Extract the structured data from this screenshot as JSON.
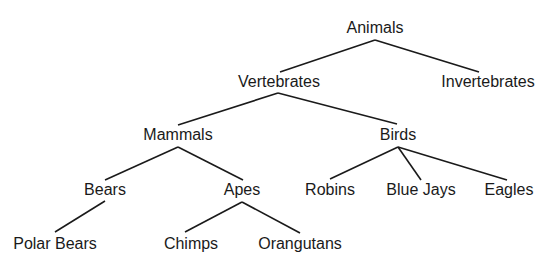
{
  "diagram": {
    "type": "tree",
    "nodes": [
      {
        "id": "animals",
        "label": "Animals",
        "parent": null
      },
      {
        "id": "vertebrates",
        "label": "Vertebrates",
        "parent": "animals"
      },
      {
        "id": "invertebrates",
        "label": "Invertebrates",
        "parent": "animals"
      },
      {
        "id": "mammals",
        "label": "Mammals",
        "parent": "vertebrates"
      },
      {
        "id": "birds",
        "label": "Birds",
        "parent": "vertebrates"
      },
      {
        "id": "bears",
        "label": "Bears",
        "parent": "mammals"
      },
      {
        "id": "apes",
        "label": "Apes",
        "parent": "mammals"
      },
      {
        "id": "robins",
        "label": "Robins",
        "parent": "birds"
      },
      {
        "id": "blue-jays",
        "label": "Blue Jays",
        "parent": "birds"
      },
      {
        "id": "eagles",
        "label": "Eagles",
        "parent": "birds"
      },
      {
        "id": "polar-bears",
        "label": "Polar Bears",
        "parent": "bears"
      },
      {
        "id": "chimps",
        "label": "Chimps",
        "parent": "apes"
      },
      {
        "id": "orangutans",
        "label": "Orangutans",
        "parent": "apes"
      }
    ]
  }
}
